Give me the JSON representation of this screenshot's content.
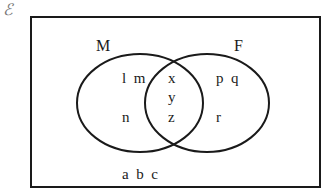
{
  "diagram": {
    "type": "venn",
    "universal_symbol": "ℰ",
    "sets": [
      {
        "name": "M",
        "label": "M"
      },
      {
        "name": "F",
        "label": "F"
      }
    ],
    "regions": {
      "M_only": [
        "l",
        "m",
        "n"
      ],
      "intersection": [
        "x",
        "y",
        "z"
      ],
      "F_only": [
        "p",
        "q",
        "r"
      ],
      "outside": [
        "a",
        "b",
        "c"
      ]
    },
    "text": {
      "M_only_row1": "l  m",
      "M_only_row2": "n",
      "inter_x": "x",
      "inter_y": "y",
      "inter_z": "z",
      "F_only_row1": "p  q",
      "F_only_row2": "r",
      "outside_row": "a  b  c"
    },
    "colors": {
      "stroke": "#1a1a1a",
      "background": "#ffffff"
    }
  }
}
